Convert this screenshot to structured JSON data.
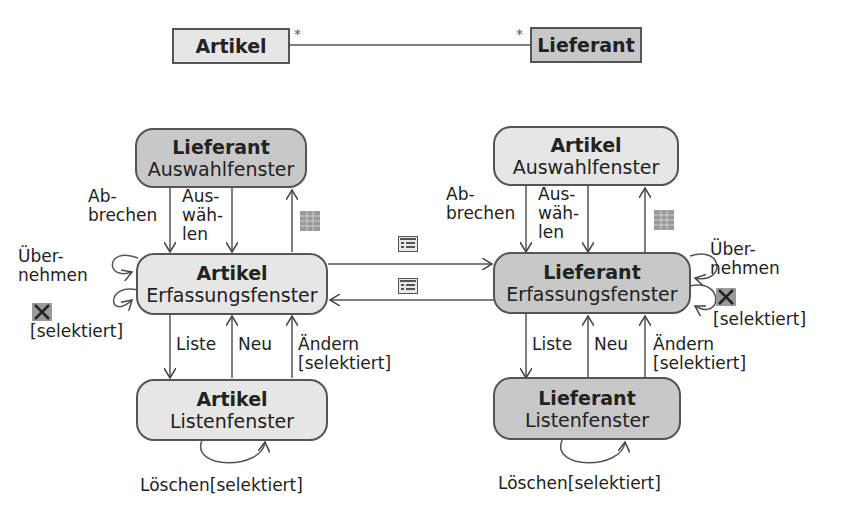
{
  "class_diagram": {
    "class_left": "Artikel",
    "class_right": "Lieferant",
    "mult_left": "*",
    "mult_right": "*"
  },
  "states": {
    "lief_auswahl": {
      "title": "Lieferant",
      "sub": "Auswahlfenster"
    },
    "art_erfassung": {
      "title": "Artikel",
      "sub": "Erfassungsfenster"
    },
    "art_liste": {
      "title": "Artikel",
      "sub": "Listenfenster"
    },
    "art_auswahl": {
      "title": "Artikel",
      "sub": "Auswahlfenster"
    },
    "lief_erfassung": {
      "title": "Lieferant",
      "sub": "Erfassungsfenster"
    },
    "lief_liste": {
      "title": "Lieferant",
      "sub": "Listenfenster"
    }
  },
  "labels": {
    "left": {
      "abbrechen": "Ab-\nbrechen",
      "auswaehlen": "Aus-\nwäh-\nlen",
      "uebernehmen": "Über-\nnehmen",
      "selektiert": "[selektiert]",
      "liste": "Liste",
      "neu": "Neu",
      "aendern": "Ändern\n[selektiert]",
      "loeschen": "Löschen[selektiert]"
    },
    "right": {
      "abbrechen": "Ab-\nbrechen",
      "auswaehlen": "Aus-\nwäh-\nlen",
      "uebernehmen": "Über-\nnehmen",
      "selektiert": "[selektiert]",
      "liste": "Liste",
      "neu": "Neu",
      "aendern": "Ändern\n[selektiert]",
      "loeschen": "Löschen[selektiert]"
    }
  },
  "icons": [
    "table-icon",
    "form-icon",
    "delete-x-icon"
  ],
  "colors": {
    "light_fill": "#e6e6e6",
    "dark_fill": "#c8c8c8",
    "stroke": "#555555"
  }
}
